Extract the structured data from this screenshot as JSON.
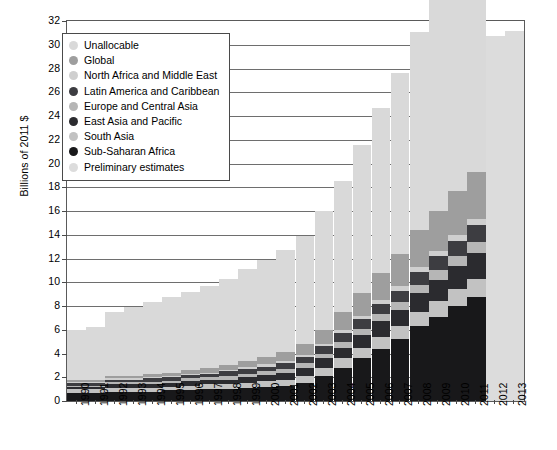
{
  "chart_data": {
    "type": "bar",
    "stacked": true,
    "title": "",
    "xlabel": "",
    "ylabel": "Billions of 2011 $",
    "ylim": [
      0,
      32
    ],
    "ytick_step": 2,
    "yticks": [
      0,
      2,
      4,
      6,
      8,
      10,
      12,
      14,
      16,
      18,
      20,
      22,
      24,
      26,
      28,
      30,
      32
    ],
    "grid": true,
    "legend_position": "upper-left-inset",
    "categories": [
      "1990",
      "1991",
      "1992",
      "1993",
      "1994",
      "1995",
      "1996",
      "1997",
      "1998",
      "1999",
      "2000",
      "2001",
      "2002",
      "2003",
      "2004",
      "2005",
      "2006",
      "2007",
      "2008",
      "2009",
      "2010",
      "2011",
      "2012",
      "2013"
    ],
    "series": [
      {
        "name": "Sub-Saharan Africa",
        "color": "#18181a",
        "values": [
          0.7,
          0.7,
          0.8,
          0.8,
          0.8,
          0.9,
          0.9,
          1.0,
          1.0,
          1.1,
          1.2,
          1.3,
          1.5,
          2.1,
          2.8,
          3.6,
          4.4,
          5.2,
          6.3,
          7.1,
          8.0,
          8.8,
          0,
          0
        ]
      },
      {
        "name": "South Asia",
        "color": "#c2c2c2",
        "values": [
          0.3,
          0.3,
          0.3,
          0.3,
          0.3,
          0.3,
          0.4,
          0.4,
          0.4,
          0.4,
          0.5,
          0.5,
          0.6,
          0.7,
          0.8,
          0.9,
          1.0,
          1.1,
          1.2,
          1.3,
          1.4,
          1.5,
          0,
          0
        ]
      },
      {
        "name": "East Asia and Pacific",
        "color": "#2b2b2f",
        "values": [
          0.2,
          0.2,
          0.3,
          0.3,
          0.3,
          0.3,
          0.4,
          0.4,
          0.4,
          0.5,
          0.5,
          0.6,
          0.7,
          0.8,
          0.9,
          1.1,
          1.3,
          1.4,
          1.6,
          1.8,
          2.0,
          2.2,
          0,
          0
        ]
      },
      {
        "name": "Europe and Central Asia",
        "color": "#b6b6b6",
        "values": [
          0.1,
          0.1,
          0.2,
          0.2,
          0.2,
          0.2,
          0.2,
          0.2,
          0.3,
          0.3,
          0.3,
          0.3,
          0.4,
          0.4,
          0.5,
          0.5,
          0.6,
          0.6,
          0.7,
          0.8,
          0.8,
          0.9,
          0,
          0
        ]
      },
      {
        "name": "Latin America and Caribbean",
        "color": "#3d3d41",
        "values": [
          0.2,
          0.2,
          0.2,
          0.2,
          0.3,
          0.3,
          0.3,
          0.3,
          0.4,
          0.4,
          0.4,
          0.5,
          0.5,
          0.6,
          0.7,
          0.8,
          0.9,
          1.0,
          1.1,
          1.2,
          1.3,
          1.4,
          0,
          0
        ]
      },
      {
        "name": "North Africa and Middle East",
        "color": "#cfcfcf",
        "values": [
          0.1,
          0.1,
          0.1,
          0.1,
          0.1,
          0.1,
          0.1,
          0.1,
          0.1,
          0.2,
          0.2,
          0.2,
          0.2,
          0.2,
          0.3,
          0.3,
          0.3,
          0.4,
          0.4,
          0.4,
          0.5,
          0.5,
          0,
          0
        ]
      },
      {
        "name": "Global",
        "color": "#9e9e9e",
        "values": [
          0.2,
          0.2,
          0.2,
          0.2,
          0.3,
          0.3,
          0.3,
          0.4,
          0.4,
          0.5,
          0.6,
          0.7,
          0.9,
          1.2,
          1.5,
          1.9,
          2.3,
          2.7,
          3.1,
          3.4,
          3.7,
          4.0,
          0,
          0
        ]
      },
      {
        "name": "Unallocable",
        "color": "#d9d9d9",
        "values": [
          4.2,
          4.4,
          5.4,
          5.8,
          6.0,
          6.4,
          6.6,
          6.9,
          7.3,
          7.7,
          8.2,
          8.6,
          9.1,
          10.0,
          11.0,
          12.5,
          13.9,
          15.2,
          16.7,
          17.9,
          19.0,
          19.7,
          0,
          0
        ]
      },
      {
        "name": "Preliminary estimates",
        "color": "#dcdcdc",
        "values": [
          0,
          0,
          0,
          0,
          0,
          0,
          0,
          0,
          0,
          0,
          0,
          0,
          0,
          0,
          0,
          0,
          0,
          0,
          0,
          0,
          0,
          0,
          30.7,
          31.2
        ]
      }
    ],
    "totals": [
      6.0,
      6.2,
      7.5,
      7.9,
      8.3,
      8.8,
      9.2,
      9.7,
      10.3,
      11.1,
      11.9,
      12.7,
      13.9,
      16.0,
      18.5,
      21.6,
      24.7,
      27.6,
      31.1,
      33.9,
      36.7,
      39.0,
      30.7,
      31.2
    ]
  },
  "legend": {
    "items": [
      {
        "label": "Unallocable",
        "color": "#d9d9d9"
      },
      {
        "label": "Global",
        "color": "#9e9e9e"
      },
      {
        "label": "North Africa and Middle East",
        "color": "#cfcfcf"
      },
      {
        "label": "Latin America and Caribbean",
        "color": "#3d3d41"
      },
      {
        "label": "Europe and Central Asia",
        "color": "#b6b6b6"
      },
      {
        "label": "East Asia and Pacific",
        "color": "#2b2b2f"
      },
      {
        "label": "South Asia",
        "color": "#c2c2c2"
      },
      {
        "label": "Sub-Saharan Africa",
        "color": "#18181a"
      },
      {
        "label": "Preliminary estimates",
        "color": "#dcdcdc"
      }
    ]
  }
}
